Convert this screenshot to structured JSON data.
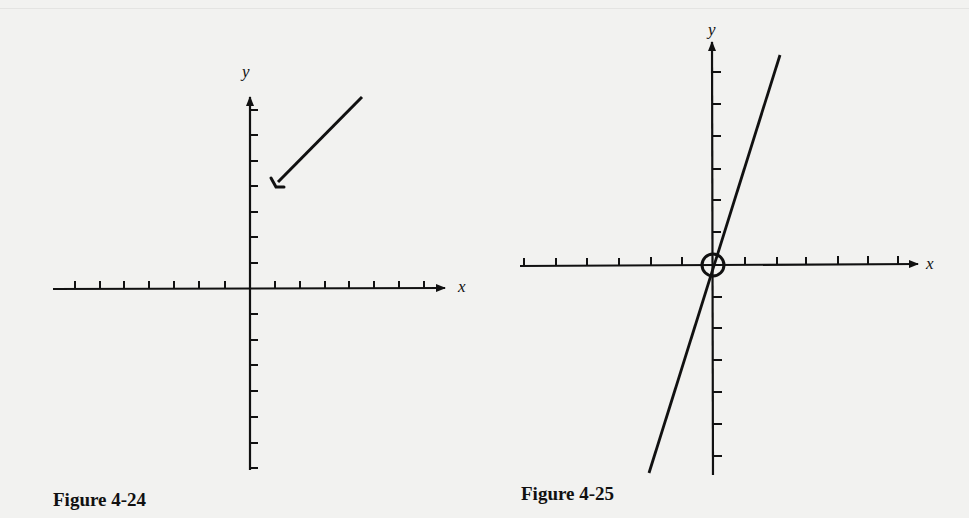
{
  "figures": [
    {
      "id": "fig-4-24",
      "caption": "Figure 4-24",
      "x_label": "x",
      "y_label": "y",
      "origin": [
        250,
        289
      ],
      "x_ticks_left": 7,
      "x_ticks_right": 7,
      "y_ticks_up": 8,
      "y_ticks_down": 8,
      "annotation": "arrow pointing to a point on the positive y-axis"
    },
    {
      "id": "fig-4-25",
      "caption": "Figure 4-25",
      "x_label": "x",
      "y_label": "y",
      "origin": [
        712,
        265
      ],
      "x_ticks_left": 7,
      "x_ticks_right": 6,
      "y_ticks_up": 7,
      "y_ticks_down": 6,
      "annotation": "line through the origin with origin circled"
    }
  ],
  "colors": {
    "background": "#f2f2f0",
    "ink": "#111111"
  }
}
